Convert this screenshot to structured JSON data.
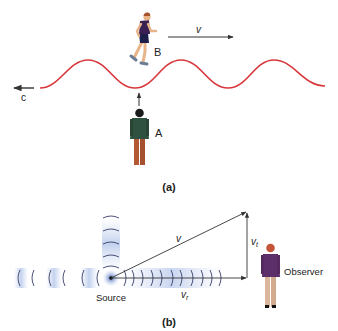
{
  "figure": {
    "part_a": {
      "caption": "(a)",
      "runner_label": "B",
      "runner_velocity_label": "v",
      "wave_speed_label": "c",
      "stationary_label": "A",
      "wave_color": "#d8363a"
    },
    "part_b": {
      "caption": "(b)",
      "velocity_label": "v",
      "tangential_label": "v",
      "tangential_subscript": "t",
      "radial_label": "v",
      "radial_subscript": "r",
      "source_label": "Source",
      "observer_label": "Observer",
      "wavefront_color": "#3a3f6a",
      "halo_color": "#9fb4dc"
    }
  }
}
